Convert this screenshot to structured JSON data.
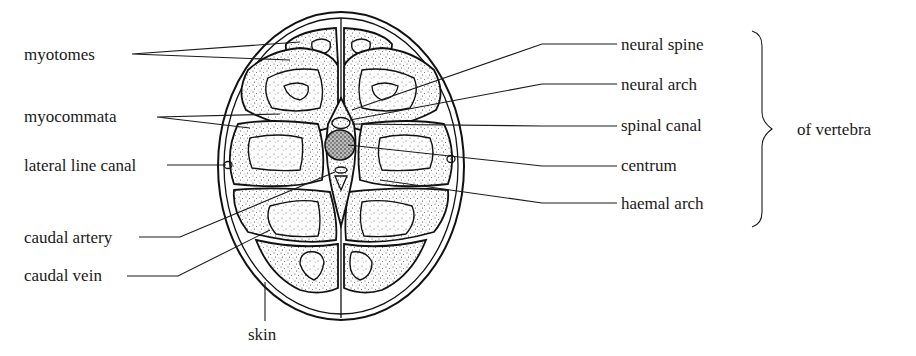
{
  "figure": {
    "left_labels": [
      {
        "id": "myotomes",
        "text": "myotomes"
      },
      {
        "id": "myocommata",
        "text": "myocommata"
      },
      {
        "id": "lateral-line-canal",
        "text": "lateral line canal"
      },
      {
        "id": "caudal-artery",
        "text": "caudal artery"
      },
      {
        "id": "caudal-vein",
        "text": "caudal vein"
      }
    ],
    "bottom_label": {
      "id": "skin",
      "text": "skin"
    },
    "right_labels": [
      {
        "id": "neural-spine",
        "text": "neural spine"
      },
      {
        "id": "neural-arch",
        "text": "neural arch"
      },
      {
        "id": "spinal-canal",
        "text": "spinal canal"
      },
      {
        "id": "centrum",
        "text": "centrum"
      },
      {
        "id": "haemal-arch",
        "text": "haemal arch"
      }
    ],
    "bracket_label": {
      "id": "of-vertebra",
      "text": "of vertebra"
    }
  },
  "colors": {
    "ink": "#1a1a1a",
    "background": "#ffffff"
  }
}
